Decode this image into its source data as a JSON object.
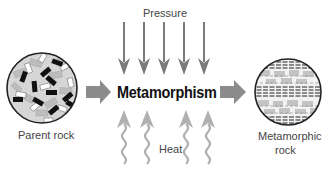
{
  "diagram": {
    "title": "Metamorphism",
    "inputs": {
      "top_label": "Pressure",
      "bottom_label": "Heat"
    },
    "source": {
      "label": "Parent rock"
    },
    "result": {
      "label_line1": "Metamorphic",
      "label_line2": "rock"
    },
    "colors": {
      "pressure_arrow": "#7a7a7a",
      "heat_arrow": "#b0b0b0",
      "flow_arrow": "#8c8c8c",
      "text": "#444444",
      "title": "#111111"
    }
  }
}
